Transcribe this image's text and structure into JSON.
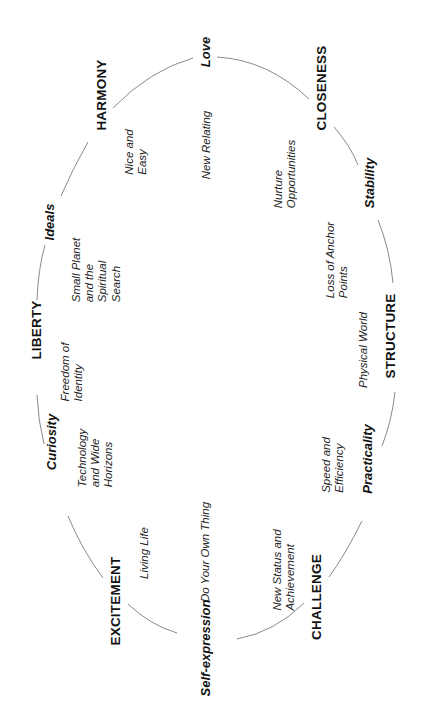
{
  "diagram": {
    "orientation": "rotated 90 degrees counter-clockwise",
    "shape": "ellipse-cycle",
    "stroke_color": "#8a8a8a",
    "text_color": "#111111",
    "ring_nodes": [
      {
        "id": "love",
        "label": "Love",
        "style": "bold-italic"
      },
      {
        "id": "closeness",
        "label": "CLOSENESS",
        "style": "bold-caps"
      },
      {
        "id": "stability",
        "label": "Stability",
        "style": "bold-italic"
      },
      {
        "id": "structure",
        "label": "STRUCTURE",
        "style": "bold-caps"
      },
      {
        "id": "practicality",
        "label": "Practicality",
        "style": "bold-italic"
      },
      {
        "id": "challenge",
        "label": "CHALLENGE",
        "style": "bold-caps"
      },
      {
        "id": "self_expression",
        "label": "Self-expression",
        "style": "bold-italic"
      },
      {
        "id": "excitement",
        "label": "EXCITEMENT",
        "style": "bold-caps"
      },
      {
        "id": "curiosity",
        "label": "Curiosity",
        "style": "bold-italic"
      },
      {
        "id": "liberty",
        "label": "LIBERTY",
        "style": "bold-caps"
      },
      {
        "id": "ideals",
        "label": "Ideals",
        "style": "bold-italic"
      },
      {
        "id": "harmony",
        "label": "HARMONY",
        "style": "bold-caps"
      }
    ],
    "inner_notes": {
      "nice_and_easy": [
        "Nice and",
        "Easy"
      ],
      "new_relating": [
        "New Relating"
      ],
      "nurture_opportunities": [
        "Nurture",
        "Opportunities"
      ],
      "loss_of_anchor_points": [
        "Loss of Anchor",
        "Points"
      ],
      "physical_world": [
        "Physical World"
      ],
      "speed_and_efficiency": [
        "Speed and",
        "Efficiency"
      ],
      "new_status_and_achievement": [
        "New Status and",
        "Achievement"
      ],
      "do_your_own_thing": [
        "Do Your Own Thing"
      ],
      "living_life": [
        "Living Life"
      ],
      "technology_and_wide_horizons": [
        "Technology",
        "and Wide",
        "Horizons"
      ],
      "freedom_of_identity": [
        "Freedom of",
        "Identity"
      ],
      "small_planet": [
        "Small Planet",
        "and the",
        "Spiritual",
        "Search"
      ]
    }
  }
}
